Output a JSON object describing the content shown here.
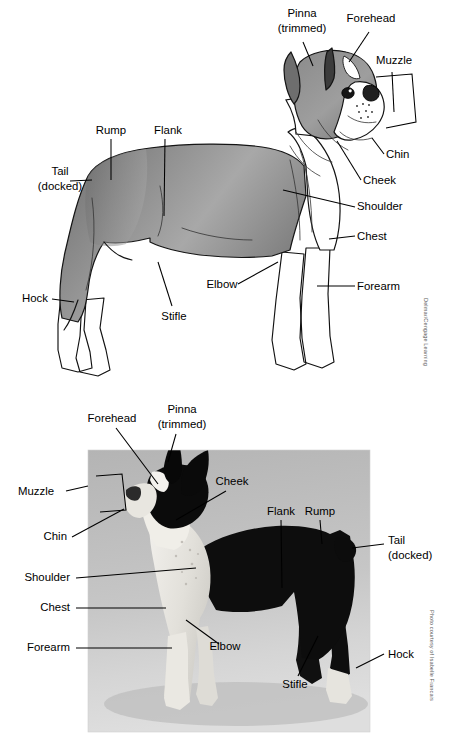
{
  "figure": {
    "background_color": "#ffffff",
    "label_text_color": "#000000",
    "leader_line_color": "#000000"
  },
  "illustration_panel": {
    "name": "line-drawing-of-boston-terrier",
    "credit": "Delmar/Cengage Learning",
    "body_fill_dark": "#6f6f6f",
    "body_fill_mid": "#8e8e8e",
    "body_fill_light": "#b4b4b4",
    "white_fill": "#ffffff",
    "labels": [
      {
        "id": "pinna",
        "line1": "Pinna",
        "line2": "(trimmed)",
        "x": 302,
        "y": 17,
        "anchor": "middle"
      },
      {
        "id": "forehead",
        "line1": "Forehead",
        "line2": "",
        "x": 371,
        "y": 22,
        "anchor": "middle"
      },
      {
        "id": "muzzle",
        "line1": "Muzzle",
        "line2": "",
        "x": 394,
        "y": 64,
        "anchor": "middle"
      },
      {
        "id": "chin",
        "line1": "Chin",
        "line2": "",
        "x": 386,
        "y": 158,
        "anchor": "start"
      },
      {
        "id": "cheek",
        "line1": "Cheek",
        "line2": "",
        "x": 363,
        "y": 184,
        "anchor": "start"
      },
      {
        "id": "shoulder",
        "line1": "Shoulder",
        "line2": "",
        "x": 357,
        "y": 210,
        "anchor": "start"
      },
      {
        "id": "chest",
        "line1": "Chest",
        "line2": "",
        "x": 357,
        "y": 240,
        "anchor": "start"
      },
      {
        "id": "forearm",
        "line1": "Forearm",
        "line2": "",
        "x": 357,
        "y": 290,
        "anchor": "start"
      },
      {
        "id": "rump",
        "line1": "Rump",
        "line2": "",
        "x": 111,
        "y": 134,
        "anchor": "middle"
      },
      {
        "id": "flank",
        "line1": "Flank",
        "line2": "",
        "x": 168,
        "y": 134,
        "anchor": "middle"
      },
      {
        "id": "tail",
        "line1": "Tail",
        "line2": "(docked)",
        "x": 60,
        "y": 175,
        "anchor": "middle"
      },
      {
        "id": "hock",
        "line1": "Hock",
        "line2": "",
        "x": 48,
        "y": 302,
        "anchor": "end"
      },
      {
        "id": "stifle",
        "line1": "Stifle",
        "line2": "",
        "x": 174,
        "y": 320,
        "anchor": "middle"
      },
      {
        "id": "elbow",
        "line1": "Elbow",
        "line2": "",
        "x": 222,
        "y": 288,
        "anchor": "middle"
      }
    ]
  },
  "photograph_panel": {
    "name": "photograph-of-boston-terrier",
    "credit": "Photo courtesy of Isabelle Francais",
    "photo_bg_top": "#b9b9b9",
    "photo_bg_bottom": "#d8d8d8",
    "dog_dark": "#141414",
    "dog_light": "#eceae6",
    "labels": [
      {
        "id": "forehead",
        "line1": "Forehead",
        "line2": "",
        "x": 112,
        "y": 30,
        "anchor": "middle"
      },
      {
        "id": "pinna",
        "line1": "Pinna",
        "line2": "(trimmed)",
        "x": 182,
        "y": 21,
        "anchor": "middle"
      },
      {
        "id": "cheek",
        "line1": "Cheek",
        "line2": "",
        "x": 232,
        "y": 93,
        "anchor": "middle"
      },
      {
        "id": "muzzle",
        "line1": "Muzzle",
        "line2": "",
        "x": 50,
        "y": 101,
        "anchor": "middle"
      },
      {
        "id": "chin",
        "line1": "Chin",
        "line2": "",
        "x": 67,
        "y": 148,
        "anchor": "end"
      },
      {
        "id": "shoulder",
        "line1": "Shoulder",
        "line2": "",
        "x": 70,
        "y": 189,
        "anchor": "end"
      },
      {
        "id": "chest",
        "line1": "Chest",
        "line2": "",
        "x": 70,
        "y": 219,
        "anchor": "end"
      },
      {
        "id": "forearm",
        "line1": "Forearm",
        "line2": "",
        "x": 70,
        "y": 259,
        "anchor": "end"
      },
      {
        "id": "flank",
        "line1": "Flank",
        "line2": "",
        "x": 281,
        "y": 123,
        "anchor": "middle"
      },
      {
        "id": "rump",
        "line1": "Rump",
        "line2": "",
        "x": 320,
        "y": 123,
        "anchor": "middle"
      },
      {
        "id": "tail",
        "line1": "Tail",
        "line2": "(docked)",
        "x": 388,
        "y": 152,
        "anchor": "start"
      },
      {
        "id": "hock",
        "line1": "Hock",
        "line2": "",
        "x": 388,
        "y": 266,
        "anchor": "start"
      },
      {
        "id": "stifle",
        "line1": "Stifle",
        "line2": "",
        "x": 295,
        "y": 296,
        "anchor": "middle"
      },
      {
        "id": "elbow",
        "line1": "Elbow",
        "line2": "",
        "x": 225,
        "y": 258,
        "anchor": "middle"
      }
    ]
  },
  "anatomy_terms": [
    "Pinna (trimmed)",
    "Forehead",
    "Muzzle",
    "Chin",
    "Cheek",
    "Shoulder",
    "Chest",
    "Forearm",
    "Elbow",
    "Rump",
    "Flank",
    "Tail (docked)",
    "Stifle",
    "Hock"
  ]
}
